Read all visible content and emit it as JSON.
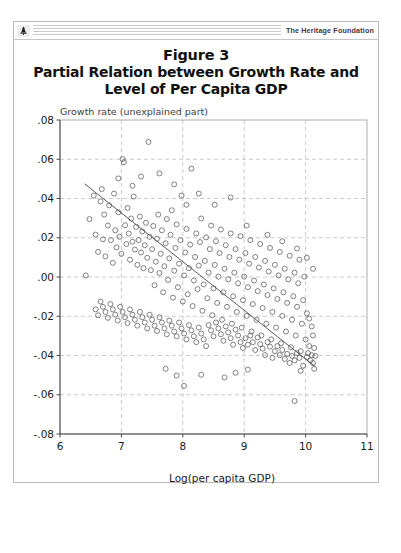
{
  "header": {
    "org_name": "The Heritage Foundation",
    "logo_icon": "heritage-liberty-bell-icon"
  },
  "figure": {
    "number_label": "Figure 3",
    "title_line_1": "Partial Relation between Growth Rate and",
    "title_line_2": "Level of Per Capita GDP"
  },
  "bottom_caption": "",
  "chart_data": {
    "type": "scatter",
    "title": "Partial Relation between Growth Rate and Level of Per Capita GDP",
    "subtitle": "Figure 3",
    "xlabel": "Log(per capita GDP)",
    "ylabel": "",
    "plot_note": "Growth rate (unexplained part)",
    "xlim": [
      6,
      11
    ],
    "ylim": [
      -0.08,
      0.08
    ],
    "xticks": [
      6,
      7,
      8,
      9,
      10,
      11
    ],
    "xtick_labels": [
      "6",
      "7",
      "8",
      "9",
      "10",
      "11"
    ],
    "yticks": [
      -0.08,
      -0.06,
      -0.04,
      -0.02,
      0.0,
      0.02,
      0.04,
      0.06,
      0.08
    ],
    "ytick_labels": [
      "-.08",
      "-.06",
      "-.04",
      "-.02",
      ".00",
      ".02",
      ".04",
      ".06",
      ".08"
    ],
    "grid": true,
    "grid_style": "dashed",
    "legend": "none",
    "marker": "open-circle",
    "series": [
      {
        "name": "Countries",
        "fit_line": {
          "x": [
            6.4,
            10.15
          ],
          "y": [
            0.0475,
            -0.0455
          ],
          "type": "linear-fit"
        },
        "points": [
          [
            6.42,
            0.0008
          ],
          [
            6.48,
            0.0295
          ],
          [
            6.55,
            0.0415
          ],
          [
            6.58,
            0.0216
          ],
          [
            6.62,
            0.0128
          ],
          [
            6.66,
            0.0385
          ],
          [
            6.7,
            0.0192
          ],
          [
            6.72,
            0.0318
          ],
          [
            6.74,
            0.0105
          ],
          [
            6.78,
            0.0262
          ],
          [
            6.8,
            0.0365
          ],
          [
            6.83,
            0.0188
          ],
          [
            6.86,
            0.0072
          ],
          [
            6.88,
            0.0425
          ],
          [
            6.9,
            0.0238
          ],
          [
            6.92,
            0.0151
          ],
          [
            6.95,
            0.033
          ],
          [
            6.97,
            0.0205
          ],
          [
            7.0,
            0.0118
          ],
          [
            7.02,
            0.0601
          ],
          [
            7.04,
            0.0585
          ],
          [
            7.06,
            0.0264
          ],
          [
            7.08,
            0.0168
          ],
          [
            7.1,
            0.0352
          ],
          [
            7.12,
            0.0221
          ],
          [
            7.14,
            0.0088
          ],
          [
            7.16,
            0.0298
          ],
          [
            7.18,
            0.018
          ],
          [
            7.2,
            0.041
          ],
          [
            7.22,
            0.014
          ],
          [
            7.24,
            0.0255
          ],
          [
            7.26,
            0.0062
          ],
          [
            7.28,
            0.0188
          ],
          [
            7.3,
            0.0308
          ],
          [
            7.32,
            0.0125
          ],
          [
            7.34,
            0.0232
          ],
          [
            7.36,
            0.0045
          ],
          [
            7.38,
            0.0162
          ],
          [
            7.4,
            0.0276
          ],
          [
            7.42,
            0.0098
          ],
          [
            7.44,
            0.0688
          ],
          [
            7.46,
            0.0205
          ],
          [
            7.48,
            0.0035
          ],
          [
            7.5,
            0.0142
          ],
          [
            7.52,
            0.026
          ],
          [
            7.54,
            -0.0042
          ],
          [
            7.56,
            0.0078
          ],
          [
            7.58,
            0.0195
          ],
          [
            7.6,
            0.0318
          ],
          [
            7.62,
            0.002
          ],
          [
            7.64,
            0.0118
          ],
          [
            7.66,
            0.0238
          ],
          [
            7.68,
            -0.0078
          ],
          [
            7.7,
            0.0055
          ],
          [
            7.72,
            0.0172
          ],
          [
            7.74,
            0.0295
          ],
          [
            7.76,
            -0.0015
          ],
          [
            7.78,
            0.0095
          ],
          [
            7.8,
            0.0215
          ],
          [
            7.82,
            0.034
          ],
          [
            7.84,
            -0.0105
          ],
          [
            7.86,
            0.0032
          ],
          [
            7.88,
            0.0148
          ],
          [
            7.9,
            0.0268
          ],
          [
            7.92,
            -0.0052
          ],
          [
            7.94,
            0.0068
          ],
          [
            7.96,
            0.0188
          ],
          [
            7.98,
            0.0415
          ],
          [
            8.0,
            -0.0125
          ],
          [
            8.02,
            0.0008
          ],
          [
            8.04,
            0.0125
          ],
          [
            8.06,
            0.0245
          ],
          [
            8.08,
            -0.0088
          ],
          [
            8.1,
            0.0045
          ],
          [
            8.12,
            0.0165
          ],
          [
            8.14,
            0.0552
          ],
          [
            8.16,
            -0.0148
          ],
          [
            8.18,
            -0.0018
          ],
          [
            8.2,
            0.0102
          ],
          [
            8.22,
            0.0222
          ],
          [
            8.24,
            -0.0062
          ],
          [
            8.26,
            0.0058
          ],
          [
            8.28,
            0.0178
          ],
          [
            8.3,
            0.0298
          ],
          [
            8.32,
            -0.0172
          ],
          [
            8.34,
            -0.0038
          ],
          [
            8.36,
            0.0082
          ],
          [
            8.38,
            0.0202
          ],
          [
            8.4,
            -0.0108
          ],
          [
            8.42,
            0.0022
          ],
          [
            8.44,
            0.0142
          ],
          [
            8.46,
            0.0262
          ],
          [
            8.48,
            -0.0195
          ],
          [
            8.5,
            -0.0058
          ],
          [
            8.52,
            0.0062
          ],
          [
            8.54,
            0.0182
          ],
          [
            8.56,
            -0.0132
          ],
          [
            8.58,
            0.0002
          ],
          [
            8.6,
            0.0122
          ],
          [
            8.62,
            0.0242
          ],
          [
            8.64,
            -0.0218
          ],
          [
            8.66,
            -0.0078
          ],
          [
            8.68,
            0.0042
          ],
          [
            8.7,
            0.0162
          ],
          [
            8.72,
            -0.0152
          ],
          [
            8.74,
            -0.0012
          ],
          [
            8.76,
            0.0102
          ],
          [
            8.78,
            0.0222
          ],
          [
            8.8,
            -0.0238
          ],
          [
            8.82,
            -0.0098
          ],
          [
            8.84,
            0.0022
          ],
          [
            8.86,
            0.0142
          ],
          [
            8.88,
            -0.0178
          ],
          [
            8.9,
            -0.0032
          ],
          [
            8.92,
            0.0088
          ],
          [
            8.94,
            0.0208
          ],
          [
            8.96,
            -0.0258
          ],
          [
            8.98,
            -0.0118
          ],
          [
            9.0,
            0.0002
          ],
          [
            9.02,
            0.0122
          ],
          [
            9.04,
            -0.0198
          ],
          [
            9.06,
            -0.0052
          ],
          [
            9.08,
            0.0068
          ],
          [
            9.1,
            0.0188
          ],
          [
            9.12,
            -0.0278
          ],
          [
            9.14,
            -0.0138
          ],
          [
            9.16,
            -0.0018
          ],
          [
            9.18,
            0.0102
          ],
          [
            9.2,
            -0.0218
          ],
          [
            9.22,
            -0.0072
          ],
          [
            9.24,
            0.0048
          ],
          [
            9.26,
            0.0168
          ],
          [
            9.28,
            -0.0298
          ],
          [
            9.3,
            -0.0158
          ],
          [
            9.32,
            -0.0038
          ],
          [
            9.34,
            0.0082
          ],
          [
            9.36,
            -0.0238
          ],
          [
            9.38,
            -0.0092
          ],
          [
            9.4,
            0.0028
          ],
          [
            9.42,
            0.0148
          ],
          [
            9.44,
            -0.0318
          ],
          [
            9.46,
            -0.0178
          ],
          [
            9.48,
            -0.0058
          ],
          [
            9.5,
            0.0062
          ],
          [
            9.52,
            -0.0258
          ],
          [
            9.54,
            -0.0112
          ],
          [
            9.56,
            0.0008
          ],
          [
            9.58,
            0.0128
          ],
          [
            9.6,
            -0.0338
          ],
          [
            9.62,
            -0.0198
          ],
          [
            9.64,
            -0.0078
          ],
          [
            9.66,
            0.0042
          ],
          [
            9.68,
            -0.0278
          ],
          [
            9.7,
            -0.0132
          ],
          [
            9.72,
            -0.0012
          ],
          [
            9.74,
            0.0108
          ],
          [
            9.76,
            -0.0358
          ],
          [
            9.78,
            -0.0218
          ],
          [
            9.8,
            -0.0098
          ],
          [
            9.82,
            0.0022
          ],
          [
            9.84,
            -0.0298
          ],
          [
            9.86,
            -0.0152
          ],
          [
            9.88,
            -0.0032
          ],
          [
            9.9,
            0.0088
          ],
          [
            9.92,
            -0.0378
          ],
          [
            9.94,
            -0.0238
          ],
          [
            9.96,
            -0.0118
          ],
          [
            9.98,
            0.0002
          ],
          [
            10.0,
            -0.0318
          ],
          [
            10.02,
            -0.0408
          ],
          [
            10.04,
            -0.0388
          ],
          [
            10.06,
            -0.0352
          ],
          [
            10.08,
            -0.0425
          ],
          [
            10.1,
            -0.0398
          ],
          [
            10.12,
            -0.0438
          ],
          [
            10.14,
            -0.0362
          ],
          [
            9.9,
            -0.0412
          ],
          [
            9.86,
            -0.0388
          ],
          [
            9.82,
            -0.0425
          ],
          [
            9.78,
            -0.0402
          ],
          [
            9.74,
            -0.0438
          ],
          [
            9.7,
            -0.0392
          ],
          [
            9.66,
            -0.0418
          ],
          [
            9.62,
            -0.0372
          ],
          [
            9.58,
            -0.0398
          ],
          [
            9.54,
            -0.0352
          ],
          [
            9.5,
            -0.0378
          ],
          [
            9.46,
            -0.0412
          ],
          [
            9.42,
            -0.0355
          ],
          [
            9.38,
            -0.0332
          ],
          [
            9.34,
            -0.0398
          ],
          [
            9.3,
            -0.0365
          ],
          [
            9.26,
            -0.0342
          ],
          [
            9.22,
            -0.0308
          ],
          [
            9.18,
            -0.0372
          ],
          [
            9.14,
            -0.0332
          ],
          [
            9.1,
            -0.0298
          ],
          [
            9.06,
            -0.0345
          ],
          [
            9.02,
            -0.0312
          ],
          [
            8.98,
            -0.0362
          ],
          [
            8.94,
            -0.0332
          ],
          [
            8.9,
            -0.0298
          ],
          [
            8.86,
            -0.0268
          ],
          [
            8.82,
            -0.0345
          ],
          [
            8.78,
            -0.0312
          ],
          [
            8.74,
            -0.0282
          ],
          [
            8.7,
            -0.0252
          ],
          [
            8.66,
            -0.0325
          ],
          [
            8.62,
            -0.0292
          ],
          [
            8.58,
            -0.0262
          ],
          [
            8.54,
            -0.0232
          ],
          [
            8.5,
            -0.0302
          ],
          [
            8.46,
            -0.0272
          ],
          [
            8.42,
            -0.0245
          ],
          [
            8.38,
            -0.0352
          ],
          [
            8.34,
            -0.0318
          ],
          [
            8.3,
            -0.0288
          ],
          [
            8.26,
            -0.0258
          ],
          [
            8.22,
            -0.0332
          ],
          [
            8.18,
            -0.0302
          ],
          [
            8.14,
            -0.0272
          ],
          [
            8.1,
            -0.0245
          ],
          [
            8.06,
            -0.0318
          ],
          [
            8.02,
            -0.0288
          ],
          [
            7.98,
            -0.0262
          ],
          [
            7.94,
            -0.0232
          ],
          [
            7.9,
            -0.0302
          ],
          [
            7.86,
            -0.0278
          ],
          [
            7.82,
            -0.0248
          ],
          [
            7.78,
            -0.0222
          ],
          [
            7.74,
            -0.0292
          ],
          [
            7.7,
            -0.0262
          ],
          [
            7.66,
            -0.0232
          ],
          [
            7.62,
            -0.0205
          ],
          [
            7.58,
            -0.0275
          ],
          [
            7.54,
            -0.0248
          ],
          [
            7.5,
            -0.0218
          ],
          [
            7.46,
            -0.0192
          ],
          [
            7.42,
            -0.0262
          ],
          [
            7.38,
            -0.0232
          ],
          [
            7.34,
            -0.0205
          ],
          [
            7.3,
            -0.0178
          ],
          [
            7.26,
            -0.0248
          ],
          [
            7.22,
            -0.0218
          ],
          [
            7.18,
            -0.0192
          ],
          [
            7.14,
            -0.0165
          ],
          [
            7.1,
            -0.0235
          ],
          [
            7.06,
            -0.0205
          ],
          [
            7.02,
            -0.0178
          ],
          [
            6.98,
            -0.0152
          ],
          [
            6.94,
            -0.0222
          ],
          [
            6.9,
            -0.0192
          ],
          [
            6.86,
            -0.0165
          ],
          [
            6.82,
            -0.0138
          ],
          [
            6.78,
            -0.0208
          ],
          [
            6.74,
            -0.0178
          ],
          [
            6.7,
            -0.0152
          ],
          [
            6.66,
            -0.0125
          ],
          [
            6.62,
            -0.0195
          ],
          [
            6.58,
            -0.0165
          ],
          [
            9.82,
            -0.0632
          ],
          [
            8.02,
            -0.0555
          ],
          [
            8.3,
            -0.0498
          ],
          [
            8.68,
            -0.0512
          ],
          [
            8.86,
            -0.0488
          ],
          [
            9.06,
            -0.0472
          ],
          [
            7.72,
            -0.0468
          ],
          [
            7.9,
            -0.0502
          ],
          [
            10.12,
            -0.0298
          ],
          [
            10.1,
            -0.0252
          ],
          [
            10.06,
            -0.0212
          ],
          [
            10.02,
            -0.0185
          ],
          [
            9.96,
            -0.0452
          ],
          [
            9.92,
            -0.0478
          ],
          [
            10.14,
            -0.0468
          ],
          [
            10.16,
            -0.0402
          ],
          [
            8.52,
            0.0368
          ],
          [
            8.78,
            0.0405
          ],
          [
            9.04,
            0.0262
          ],
          [
            9.38,
            0.0215
          ],
          [
            9.62,
            0.0182
          ],
          [
            9.86,
            0.0145
          ],
          [
            10.02,
            0.0098
          ],
          [
            10.12,
            0.0042
          ],
          [
            7.62,
            0.0528
          ],
          [
            7.86,
            0.0472
          ],
          [
            8.06,
            0.0368
          ],
          [
            8.26,
            0.0425
          ],
          [
            6.95,
            0.0502
          ],
          [
            7.18,
            0.0465
          ],
          [
            6.68,
            0.0448
          ],
          [
            7.32,
            0.0512
          ]
        ]
      }
    ]
  }
}
